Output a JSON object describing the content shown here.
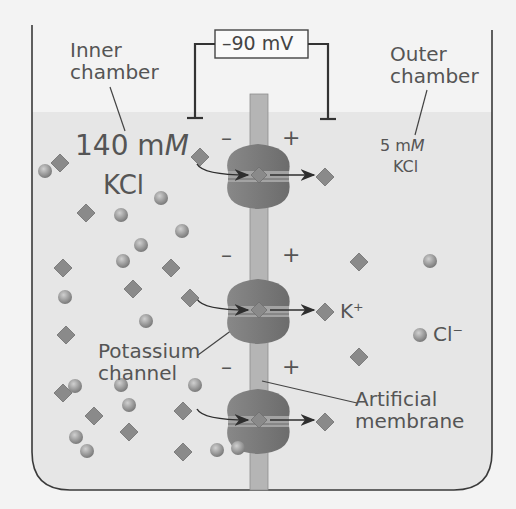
{
  "figure": {
    "voltmeter": {
      "reading": "–90 mV"
    },
    "inner_chamber": {
      "label_line1": "Inner",
      "label_line2": "chamber",
      "concentration_value": "140 m",
      "concentration_unit": "M",
      "solute": "KCl"
    },
    "outer_chamber": {
      "label_line1": "Outer",
      "label_line2": "chamber",
      "concentration_value": "5 m",
      "concentration_unit": "M",
      "solute": "KCl"
    },
    "ion_labels": {
      "potassium": "K⁺",
      "chloride": "Cl⁻"
    },
    "callouts": {
      "channel_line1": "Potassium",
      "channel_line2": "channel",
      "membrane_line1": "Artificial",
      "membrane_line2": "membrane"
    },
    "charge_signs": {
      "negative": "–",
      "positive": "+"
    },
    "colors": {
      "background": "#f3f3f3",
      "fluid": "#e6e6e6",
      "container_outline": "#3a3a3a",
      "membrane": "#b5b5b5",
      "channel": "#7d7d7d",
      "potassium_ion": "#8a8a8a",
      "chloride_ion": "#a6a6a6",
      "arrow": "#2e2e2e"
    },
    "particles": {
      "potassium_diamonds_inner": [
        [
          60,
          163
        ],
        [
          200,
          157
        ],
        [
          86,
          213
        ],
        [
          63,
          268
        ],
        [
          133,
          289
        ],
        [
          171,
          268
        ],
        [
          190,
          298
        ],
        [
          66,
          335
        ],
        [
          94,
          416
        ],
        [
          129,
          432
        ],
        [
          63,
          393
        ],
        [
          183,
          411
        ],
        [
          183,
          452
        ]
      ],
      "chloride_spheres_inner": [
        [
          45,
          171
        ],
        [
          161,
          198
        ],
        [
          121,
          215
        ],
        [
          123,
          261
        ],
        [
          141,
          245
        ],
        [
          182,
          231
        ],
        [
          65,
          297
        ],
        [
          146,
          321
        ],
        [
          75,
          386
        ],
        [
          129,
          405
        ],
        [
          76,
          437
        ],
        [
          87,
          451
        ],
        [
          121,
          385
        ],
        [
          195,
          385
        ],
        [
          217,
          450
        ],
        [
          238,
          448
        ]
      ],
      "potassium_diamonds_outer": [
        [
          359,
          262
        ],
        [
          359,
          357
        ]
      ],
      "chloride_spheres_outer": [
        [
          430,
          261
        ]
      ],
      "legend_k_diamond": [
        325,
        312
      ],
      "legend_cl_sphere": [
        420,
        335
      ]
    },
    "channels_y": [
      175,
      310,
      420
    ]
  }
}
